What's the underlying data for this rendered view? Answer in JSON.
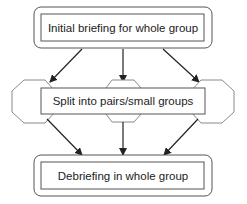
{
  "diagram": {
    "type": "flowchart",
    "nodes": [
      {
        "id": "top",
        "label": "Initial briefing for whole group",
        "shape": "rounded-double-box"
      },
      {
        "id": "middle",
        "label": "Split into pairs/small groups",
        "shape": "box-over-three-octagons"
      },
      {
        "id": "bottom",
        "label": "Debriefing in whole group",
        "shape": "rounded-double-box"
      }
    ],
    "edges": [
      {
        "from": "top",
        "to": "middle-left-octagon"
      },
      {
        "from": "top",
        "to": "middle-center-octagon"
      },
      {
        "from": "top",
        "to": "middle-right-octagon"
      },
      {
        "from": "middle-left-octagon",
        "to": "bottom"
      },
      {
        "from": "middle-center-octagon",
        "to": "bottom"
      },
      {
        "from": "middle-right-octagon",
        "to": "bottom"
      }
    ],
    "colors": {
      "stroke": "#333333",
      "octagon_stroke": "#8a8a8a",
      "text": "#222222"
    }
  }
}
